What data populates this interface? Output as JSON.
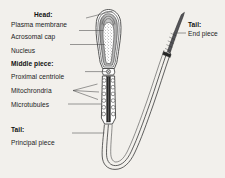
{
  "figure": {
    "background_color": "#f2f0ec",
    "ink_color": "#3a3a3a",
    "text_color": "#1b1b1b"
  },
  "labels": {
    "head_heading": "Head:",
    "plasma_membrane": "Plasma membrane",
    "acrosomal_cap": "Acrosomal cap",
    "nucleus": "Nucleus",
    "middle_piece_heading": "Middle piece:",
    "proximal_centriole": "Proximal centriole",
    "mitochondria": "Mitochrondria",
    "microtubules": "Microtubules",
    "tail_heading_left": "Tail:",
    "principal_piece": "Principal piece",
    "tail_heading_right": "Tail:",
    "end_piece": "End piece"
  },
  "structures": {
    "head": {
      "layers": [
        "plasma membrane",
        "acrosomal cap",
        "nucleus"
      ],
      "nucleus_fill": "stippled"
    },
    "middle_piece": {
      "mitochondria_per_side": 6,
      "axoneme": "dark central column"
    },
    "tail": {
      "principal_piece": "long flagellum curving down and back up",
      "end_piece": "tapering striated terminal segment"
    }
  }
}
